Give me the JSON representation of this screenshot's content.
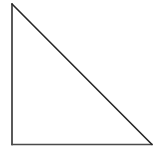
{
  "canvas": {
    "width": 160,
    "height": 152,
    "background_color": "#ffffff",
    "description": "Plain white page containing a single outlined right triangle"
  },
  "figure": {
    "name": "right-triangle",
    "shape_label": "right triangle",
    "fill": "none",
    "stroke_color": "#262626",
    "stroke_width": 1.6,
    "leg_stroke_color": "#303030",
    "base_stroke_color": "#4a4a4a",
    "base_stroke_width": 1.3,
    "right_angle_position": "bottom-left",
    "orientation": "hypotenuse from top-left apex down to bottom-right",
    "vertices": [
      {
        "name": "apex",
        "x": 12,
        "y": 4
      },
      {
        "name": "bottom-left",
        "x": 12,
        "y": 144.5
      },
      {
        "name": "bottom-right",
        "x": 152,
        "y": 144.5
      }
    ],
    "edges": [
      {
        "name": "vertical-leg",
        "from": "apex",
        "to": "bottom-left",
        "length_px": 140.5
      },
      {
        "name": "horizontal-base",
        "from": "bottom-left",
        "to": "bottom-right",
        "length_px": 140
      },
      {
        "name": "hypotenuse",
        "from": "apex",
        "to": "bottom-right",
        "length_px": 198.7
      }
    ]
  },
  "artifacts": {
    "label": "faint scan artifacts",
    "color": "#fdfdfd",
    "blobs": [
      {
        "x": 108,
        "y": 12,
        "w": 7,
        "h": 20
      },
      {
        "x": 100,
        "y": 40,
        "w": 22,
        "h": 12
      },
      {
        "x": 118,
        "y": 46,
        "w": 10,
        "h": 16
      },
      {
        "x": 136,
        "y": 54,
        "w": 9,
        "h": 7
      },
      {
        "x": 100,
        "y": 68,
        "w": 6,
        "h": 6
      },
      {
        "x": 130,
        "y": 98,
        "w": 24,
        "h": 26
      },
      {
        "x": 24,
        "y": 96,
        "w": 5,
        "h": 5
      },
      {
        "x": 42,
        "y": 92,
        "w": 9,
        "h": 6
      },
      {
        "x": 20,
        "y": 128,
        "w": 16,
        "h": 5
      },
      {
        "x": 56,
        "y": 6,
        "w": 6,
        "h": 5
      }
    ]
  },
  "accessibility": {
    "figure_alt": "A right triangle with the right angle at the lower left, a vertical left side, a horizontal bottom side, and a hypotenuse sloping from the top vertex down to the bottom-right vertex."
  }
}
